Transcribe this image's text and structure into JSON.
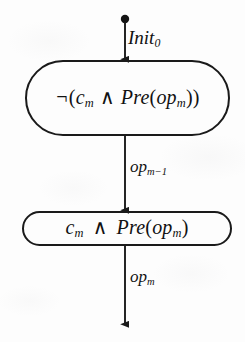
{
  "diagram": {
    "type": "state-transition-flow",
    "background_color": "#fdfdfd",
    "stroke_color": "#1a1a1a",
    "text_color": "#111111",
    "start_marker": {
      "name": "initial-state-dot",
      "shape": "filled-circle",
      "cx": 125,
      "cy": 19,
      "r": 4
    },
    "nodes": [
      {
        "id": "not-guard",
        "shape": "stadium",
        "formula_plain": "¬(c_m ∧ Pre(op_m))",
        "parts": {
          "negation": "¬",
          "open_paren": "(",
          "var": "c",
          "var_sub": "m",
          "conjunction": "∧",
          "pre": "Pre",
          "pre_open": "(",
          "op": "op",
          "op_sub": "m",
          "pre_close": ")",
          "close_paren": ")"
        }
      },
      {
        "id": "guard",
        "shape": "stadium",
        "formula_plain": "c_m ∧ Pre(op_m)",
        "parts": {
          "var": "c",
          "var_sub": "m",
          "conjunction": "∧",
          "pre": "Pre",
          "pre_open": "(",
          "op": "op",
          "op_sub": "m",
          "pre_close": ")"
        }
      }
    ],
    "edges": [
      {
        "id": "edge-init",
        "from": "initial-state-dot",
        "to": "not-guard",
        "label_plain": "Init_0",
        "label_base": "Init",
        "label_sub": "0",
        "arrowhead": true
      },
      {
        "id": "edge-op-m-minus-1",
        "from": "not-guard",
        "to": "guard",
        "label_plain": "op_{m-1}",
        "label_base": "op",
        "label_sub": "m−1",
        "arrowhead": true
      },
      {
        "id": "edge-op-m",
        "from": "guard",
        "to": "terminal",
        "label_plain": "op_m",
        "label_base": "op",
        "label_sub": "m",
        "arrowhead": true
      }
    ]
  }
}
